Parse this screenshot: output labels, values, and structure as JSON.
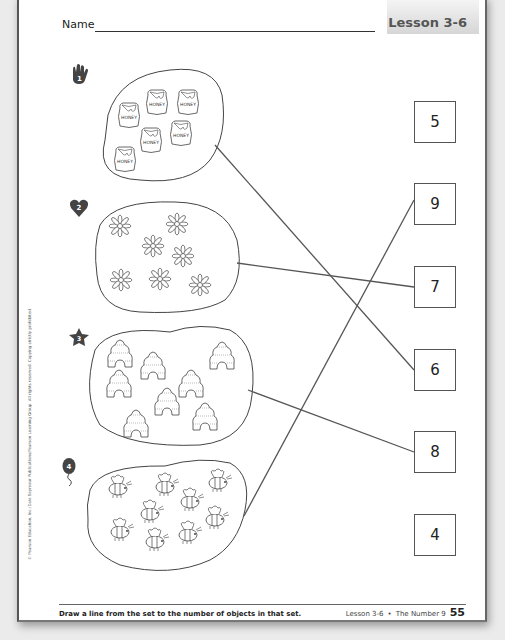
{
  "header": {
    "name_label": "Name",
    "lesson_label": "Lesson 3-6"
  },
  "copyright": "© Pearson Education, Inc./Dale Seymour Publications/Pearson Learning Group. All rights reserved. Copying strictly prohibited.",
  "sets": [
    {
      "marker": "1",
      "marker_shape": "hand-icon",
      "object": "honey jar",
      "object_label": "HONEY",
      "count": 6,
      "matched_to": "6"
    },
    {
      "marker": "2",
      "marker_shape": "heart-icon",
      "object": "flower",
      "count": 7,
      "matched_to": "7"
    },
    {
      "marker": "3",
      "marker_shape": "star-icon",
      "object": "beehive",
      "count": 8,
      "matched_to": "8"
    },
    {
      "marker": "4",
      "marker_shape": "balloon-icon",
      "object": "bee",
      "count": 9,
      "matched_to": "9"
    }
  ],
  "number_boxes": [
    "5",
    "9",
    "7",
    "6",
    "8",
    "4"
  ],
  "footer": {
    "instruction": "Draw a line from the set to the number of objects in that set.",
    "lesson": "Lesson 3-6",
    "bullet": "•",
    "topic": "The Number 9",
    "page_number": "55"
  }
}
